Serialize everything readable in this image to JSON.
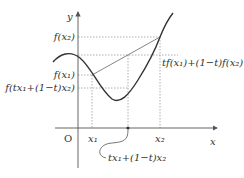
{
  "diagram": {
    "axes": {
      "x_label": "x",
      "y_label": "y",
      "origin_label": "O"
    },
    "x_ticks": {
      "x1": "x₁",
      "x2": "x₂"
    },
    "y_ticks": {
      "f_x2": "f(x₂)",
      "f_x1": "f(x₁)",
      "f_mix": "f(tx₁+(1−t)x₂)"
    },
    "annotations": {
      "chord_value": "tf(x₁)+(1−t)f(x₂)",
      "mix_point": "tx₁+(1−t)x₂"
    },
    "colors": {
      "curve": "#333333",
      "axis": "#555555",
      "dotted": "#999999",
      "chord": "#666666"
    }
  }
}
